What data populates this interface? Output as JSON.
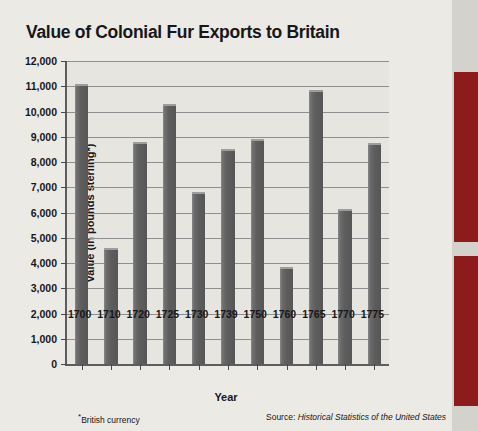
{
  "chart_data": {
    "type": "bar",
    "title": "Value of Colonial Fur Exports to Britain",
    "xlabel": "Year",
    "ylabel": "Value (in pounds sterling*)",
    "categories": [
      "1700",
      "1710",
      "1720",
      "1725",
      "1730",
      "1739",
      "1750",
      "1760",
      "1765",
      "1770",
      "1775"
    ],
    "values": [
      11100,
      4600,
      8800,
      10300,
      6800,
      8500,
      8900,
      3850,
      10850,
      6150,
      8750
    ],
    "ylim": [
      0,
      12000
    ],
    "ytick_step": 1000,
    "ytick_labels": [
      "12,000",
      "11,000",
      "10,000",
      "9,000",
      "8,000",
      "7,000",
      "6,000",
      "5,000",
      "4,000",
      "3,000",
      "2,000",
      "1,000",
      "0"
    ],
    "grid": true,
    "legend": "none",
    "footnote": "British currency",
    "footnote_marker": "*",
    "source_prefix": "Source: ",
    "source_title": "Historical Statistics of the United States",
    "bar_color": "#5e5e5e",
    "plot_background": "#e6e5e0",
    "page_background": "#eceae5",
    "axis_color": "#5d5d5d",
    "grid_color": "#8f8f8f",
    "text_color": "#17171a",
    "accent_color": "#8e1b1b"
  }
}
